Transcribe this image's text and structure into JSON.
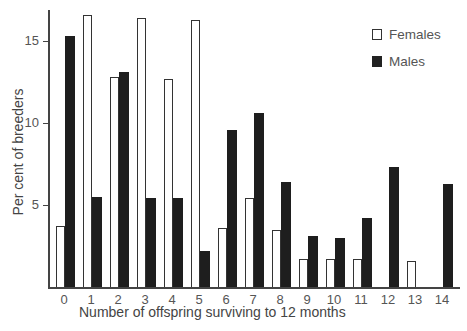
{
  "chart_data": {
    "type": "bar",
    "title": "",
    "xlabel": "Number of offspring surviving to 12 months",
    "ylabel": "Per cent of breeders",
    "categories": [
      "0",
      "1",
      "2",
      "3",
      "4",
      "5",
      "6",
      "7",
      "8",
      "9",
      "10",
      "11",
      "12",
      "13",
      "14"
    ],
    "series": [
      {
        "name": "Females",
        "color": "#ffffff",
        "values": [
          3.7,
          16.6,
          12.8,
          16.4,
          12.7,
          16.3,
          3.6,
          5.4,
          3.5,
          1.7,
          1.7,
          1.7,
          0,
          1.6,
          0
        ]
      },
      {
        "name": "Males",
        "color": "#1e1e1e",
        "values": [
          15.3,
          5.5,
          13.1,
          5.4,
          5.4,
          2.2,
          9.6,
          10.6,
          6.4,
          3.1,
          3.0,
          4.2,
          7.3,
          0,
          6.3
        ]
      }
    ],
    "yticks": [
      5,
      10,
      15
    ],
    "ylim": [
      0,
      17
    ],
    "grid": false,
    "legend_position": "top-right"
  },
  "legend": {
    "females": "Females",
    "males": "Males"
  }
}
